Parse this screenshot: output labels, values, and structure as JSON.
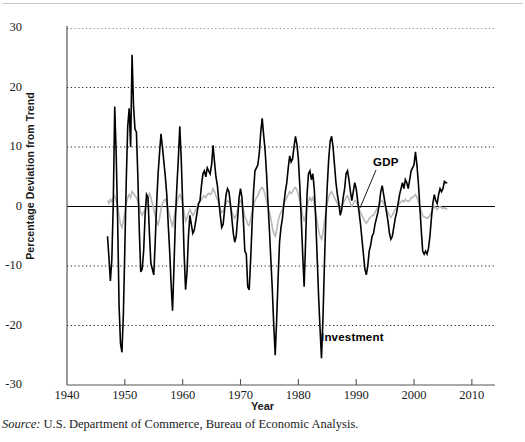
{
  "figure": {
    "source_prefix": "Source:",
    "source_text": " U.S. Department of Commerce, Bureau of Economic Analysis."
  },
  "chart_data": {
    "type": "line",
    "title": "",
    "xlabel": "Year",
    "ylabel": "Percentage Deviation from Trend",
    "xlim": [
      1940,
      2014
    ],
    "ylim": [
      -30,
      30
    ],
    "grid": true,
    "gridlines_y": [
      30,
      20,
      10,
      0,
      -10,
      -20
    ],
    "xticks": [
      1940,
      1950,
      1960,
      1970,
      1980,
      1990,
      2000,
      2010
    ],
    "xtick_labels": [
      "1940",
      "1950",
      "1960",
      "1970",
      "1980",
      "1990",
      "2000",
      "2010"
    ],
    "yticks": [
      30,
      20,
      10,
      0,
      -10,
      -20,
      -30
    ],
    "ytick_labels": [
      "30",
      "20",
      "10",
      "0",
      "-10",
      "-20",
      "-30"
    ],
    "legend_position": "inline-annotations",
    "annotations": [
      {
        "text": "GDP",
        "x": 1997.5,
        "y": 6.5,
        "leader_to_x": 1993.0,
        "leader_to_y": -0.5
      },
      {
        "text": "Investment",
        "x": 1984.5,
        "y": -23.5
      }
    ],
    "x_start": 1947.0,
    "x_step": 0.25,
    "series": [
      {
        "name": "Investment",
        "color": "#000000",
        "width": 1.6,
        "values": [
          -5.0,
          -8.5,
          -12.5,
          -9.0,
          0.5,
          16.8,
          9.0,
          -2.0,
          -16.5,
          -23.0,
          -24.5,
          -18.0,
          -7.0,
          4.5,
          13.5,
          16.5,
          10.0,
          25.5,
          17.0,
          13.0,
          12.5,
          5.0,
          -4.0,
          -11.0,
          -10.5,
          -7.5,
          -1.5,
          2.0,
          1.5,
          -4.5,
          -9.5,
          -10.5,
          -11.5,
          -6.0,
          0.5,
          5.5,
          9.0,
          12.2,
          10.0,
          7.5,
          5.0,
          2.0,
          -3.0,
          -7.5,
          -13.0,
          -17.5,
          -10.0,
          -2.0,
          3.5,
          8.0,
          13.5,
          8.0,
          0.5,
          -8.0,
          -14.0,
          -11.0,
          -5.0,
          -1.5,
          -3.0,
          -4.5,
          -4.0,
          -2.5,
          -1.0,
          0.5,
          1.0,
          3.5,
          5.5,
          6.0,
          5.0,
          6.5,
          6.0,
          5.5,
          7.0,
          10.3,
          7.5,
          5.0,
          3.5,
          1.0,
          -1.5,
          -3.5,
          -3.0,
          -0.5,
          2.0,
          3.0,
          2.5,
          0.5,
          -2.0,
          -4.5,
          -6.0,
          -5.0,
          -2.0,
          1.5,
          3.0,
          1.5,
          -2.5,
          -7.5,
          -8.0,
          -13.5,
          -14.0,
          -9.0,
          -3.0,
          2.5,
          6.0,
          6.5,
          7.0,
          9.0,
          12.5,
          14.8,
          12.0,
          9.5,
          5.5,
          0.5,
          -4.0,
          -9.0,
          -14.0,
          -20.0,
          -25.0,
          -19.0,
          -12.0,
          -6.0,
          -3.5,
          -2.0,
          0.5,
          2.5,
          4.0,
          6.5,
          8.5,
          7.5,
          8.0,
          10.0,
          11.8,
          10.5,
          8.0,
          3.5,
          -2.0,
          -8.0,
          -13.5,
          -6.0,
          2.0,
          5.5,
          6.0,
          4.5,
          5.5,
          3.0,
          -2.0,
          -8.5,
          -15.0,
          -20.5,
          -25.5,
          -19.0,
          -10.0,
          -2.0,
          3.5,
          8.0,
          11.0,
          11.8,
          10.0,
          7.0,
          4.0,
          2.0,
          0.5,
          -1.5,
          -0.5,
          1.5,
          3.0,
          5.5,
          6.0,
          4.5,
          2.5,
          1.0,
          2.5,
          4.0,
          3.0,
          1.0,
          -1.0,
          -3.0,
          -5.5,
          -8.0,
          -10.5,
          -11.5,
          -10.0,
          -7.5,
          -6.5,
          -5.0,
          -4.5,
          -3.0,
          -2.0,
          -1.0,
          0.5,
          2.5,
          3.5,
          2.0,
          0.5,
          -1.0,
          -2.5,
          -4.5,
          -5.5,
          -5.0,
          -3.5,
          -2.0,
          -1.0,
          0.5,
          2.0,
          3.0,
          4.0,
          3.0,
          4.5,
          4.0,
          3.0,
          4.5,
          6.0,
          6.5,
          7.0,
          9.2,
          7.0,
          4.0,
          0.0,
          -4.0,
          -7.5,
          -8.0,
          -7.5,
          -8.0,
          -7.0,
          -5.0,
          -2.0,
          0.5,
          2.0,
          1.0,
          0.5,
          2.0,
          3.0,
          2.5,
          3.0,
          4.2,
          4.0,
          4.0
        ]
      },
      {
        "name": "GDP",
        "color": "#b8b8b8",
        "width": 1.6,
        "values": [
          1.0,
          0.5,
          1.2,
          0.8,
          1.5,
          1.8,
          1.0,
          0.0,
          -1.5,
          -3.0,
          -3.5,
          -2.5,
          -1.0,
          0.5,
          1.5,
          2.0,
          1.5,
          2.5,
          2.2,
          1.8,
          1.5,
          1.0,
          0.0,
          -1.0,
          -1.5,
          -1.0,
          -0.5,
          0.5,
          1.5,
          2.2,
          1.5,
          0.5,
          -0.5,
          -1.5,
          -2.5,
          -3.0,
          -2.0,
          -0.5,
          0.5,
          1.0,
          1.2,
          0.5,
          -0.5,
          -1.5,
          -2.5,
          -3.5,
          -2.0,
          -0.5,
          0.5,
          1.5,
          2.0,
          1.5,
          0.5,
          -1.0,
          -2.5,
          -2.0,
          -1.0,
          -0.5,
          -1.0,
          -1.5,
          -1.2,
          -0.5,
          0.0,
          0.5,
          0.8,
          1.2,
          1.5,
          1.8,
          1.5,
          2.0,
          2.2,
          2.0,
          2.2,
          3.0,
          2.5,
          1.8,
          1.2,
          0.5,
          -0.5,
          -1.0,
          -0.8,
          0.0,
          0.5,
          1.0,
          0.8,
          0.0,
          -0.8,
          -1.5,
          -2.0,
          -1.5,
          -0.5,
          0.5,
          1.0,
          0.5,
          -0.5,
          -1.8,
          -2.2,
          -3.0,
          -3.2,
          -2.0,
          -1.0,
          0.0,
          1.0,
          1.5,
          1.8,
          2.5,
          3.0,
          3.2,
          2.8,
          2.0,
          1.0,
          0.0,
          -1.0,
          -2.0,
          -3.5,
          -4.5,
          -5.0,
          -4.0,
          -2.5,
          -1.5,
          -1.0,
          -0.5,
          0.5,
          1.0,
          1.5,
          2.0,
          2.5,
          2.2,
          2.5,
          3.0,
          3.2,
          2.8,
          2.0,
          1.0,
          0.0,
          -1.5,
          -2.5,
          -1.5,
          0.0,
          1.0,
          1.5,
          1.0,
          1.5,
          0.5,
          -1.0,
          -2.5,
          -4.0,
          -5.0,
          -5.5,
          -4.5,
          -2.5,
          -1.0,
          0.5,
          1.5,
          2.2,
          2.5,
          2.0,
          1.5,
          1.0,
          0.5,
          0.0,
          -0.5,
          0.0,
          0.5,
          1.0,
          1.5,
          1.8,
          1.2,
          0.5,
          0.0,
          0.5,
          1.0,
          0.8,
          0.2,
          -0.5,
          -1.0,
          -1.5,
          -2.0,
          -2.5,
          -2.8,
          -2.5,
          -2.0,
          -1.8,
          -1.5,
          -1.5,
          -1.0,
          -0.5,
          -0.2,
          0.2,
          0.8,
          1.0,
          0.5,
          0.0,
          -0.5,
          -1.0,
          -1.5,
          -1.8,
          -1.5,
          -1.0,
          -0.5,
          -0.2,
          0.2,
          0.5,
          0.8,
          1.0,
          0.8,
          1.2,
          1.0,
          0.8,
          1.0,
          1.5,
          1.5,
          1.8,
          2.0,
          1.5,
          0.8,
          0.0,
          -0.8,
          -1.5,
          -1.8,
          -1.8,
          -2.0,
          -1.8,
          -1.5,
          -1.0,
          -0.5,
          0.0,
          -0.2,
          -0.5,
          -0.2,
          0.0,
          -0.2,
          -0.3,
          -0.2,
          -0.4,
          -0.4
        ]
      }
    ]
  }
}
